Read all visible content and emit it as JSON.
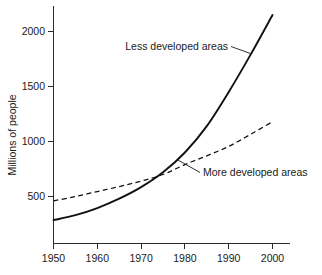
{
  "chart_data": {
    "type": "line",
    "title": "",
    "subtitle": "",
    "xlabel": "",
    "ylabel": "Millions of people",
    "xlim": [
      1950,
      2001
    ],
    "ylim": [
      0,
      2200
    ],
    "xticks": [
      1950,
      1960,
      1970,
      1980,
      1990,
      2000
    ],
    "xticklabels": [
      "1950",
      "1960",
      "1970",
      "1980",
      "1990",
      "2000"
    ],
    "yticks": [
      500,
      1000,
      1500,
      2000
    ],
    "yticklabels": [
      "500",
      "1000",
      "1500",
      "2000"
    ],
    "grid": false,
    "legend_position": "inline-annotations",
    "x": [
      1950,
      1955,
      1960,
      1965,
      1970,
      1975,
      1980,
      1985,
      1990,
      1995,
      2000
    ],
    "series": [
      {
        "name": "Less developed areas",
        "style": "solid",
        "values": [
          285,
          330,
          395,
          480,
          585,
          720,
          900,
          1140,
          1450,
          1790,
          2150
        ]
      },
      {
        "name": "More developed areas",
        "style": "dashed",
        "values": [
          460,
          500,
          545,
          590,
          640,
          700,
          790,
          870,
          955,
          1065,
          1180
        ]
      }
    ],
    "annotations": [
      {
        "id": "less-developed",
        "text": "Less developed areas",
        "text_x": 228,
        "text_y": 50,
        "anchor": "end",
        "leader": [
          [
            231,
            46
          ],
          [
            250,
            53
          ]
        ]
      },
      {
        "id": "more-developed",
        "text": "More developed areas",
        "text_x": 203,
        "text_y": 176,
        "anchor": "start",
        "leader": [
          [
            199,
            172
          ],
          [
            178,
            160
          ]
        ]
      }
    ],
    "colors": {
      "axis": "#2b2b2b",
      "series_solid": "#111111",
      "series_dashed": "#111111",
      "background": "#ffffff",
      "text": "#1a1a1a"
    }
  },
  "axis": {
    "y_title": "Millions of people",
    "y_tick_0": "500",
    "y_tick_1": "1000",
    "y_tick_2": "1500",
    "y_tick_3": "2000",
    "x_tick_0": "1950",
    "x_tick_1": "1960",
    "x_tick_2": "1970",
    "x_tick_3": "1980",
    "x_tick_4": "1990",
    "x_tick_5": "2000"
  },
  "annotations": {
    "less_developed": "Less developed areas",
    "more_developed": "More developed areas"
  }
}
